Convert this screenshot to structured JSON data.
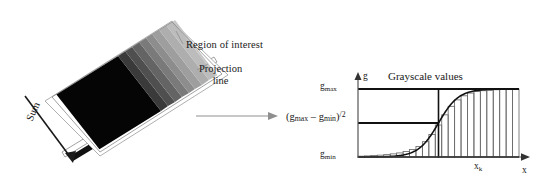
{
  "figure": {
    "background": "#ffffff"
  },
  "left_panel": {
    "name": "region-of-interest-diagram",
    "roi_label": "Region of interest",
    "projection_label_line1": "Projection",
    "projection_label_line2": "line",
    "sum_label": "Sum",
    "gradient_description": "tilted rectangular image patch, black on the left fading through discrete gray steps to light gray on the right",
    "gradient_steps": [
      "#050505",
      "#0a0a0a",
      "#101010",
      "#161616",
      "#434343",
      "#555555",
      "#6a6a6a",
      "#7c7c7c",
      "#8e8e8e",
      "#9f9f9f",
      "#adadad",
      "#b8b8b8",
      "#c2c2c2",
      "#cacaca",
      "#d0d0d0",
      "#d4d4d4"
    ],
    "colors": {
      "plate_border": "#8a8a8a",
      "plate_face": "#ffffff",
      "projection_bar": "#111111",
      "arrow": "#222222"
    }
  },
  "connector": {
    "name": "flow-arrow",
    "color": "#8f8f8f"
  },
  "chart_data": {
    "type": "bar",
    "title": "Grayscale values",
    "xlabel": "x",
    "ylabel": "g",
    "grid": false,
    "legend": false,
    "axis_arrows": true,
    "ylim": [
      0,
      1
    ],
    "ytick_labels": [
      "g_min",
      "g_max"
    ],
    "ytick_values": [
      0,
      1
    ],
    "xtick_labels": [
      "x_k"
    ],
    "xtick_values": [
      0.5
    ],
    "reference_lines": [
      {
        "name": "gmax-line",
        "y": 1.0,
        "label": "g_max"
      },
      {
        "name": "half-amplitude-line",
        "y": 0.5,
        "label": "(g_max - g_min)/2"
      }
    ],
    "vertical_marker": {
      "name": "xk-marker",
      "x": 0.5,
      "label": "x_k"
    },
    "annotations": [
      {
        "name": "gmax-annotation",
        "text": "gmax"
      },
      {
        "name": "gmin-annotation",
        "text": "gmin"
      },
      {
        "name": "formula-annotation",
        "text": "(gmax - gmin)/2"
      },
      {
        "name": "xk-annotation",
        "text": "xk"
      }
    ],
    "curve": {
      "name": "sigmoid-fit-curve",
      "description": "smooth logistic S-curve rising from g_min to g_max, inflection at x_k",
      "color": "#111111"
    },
    "categories": [
      0.02,
      0.06,
      0.1,
      0.14,
      0.18,
      0.22,
      0.26,
      0.3,
      0.34,
      0.38,
      0.42,
      0.46,
      0.5,
      0.54,
      0.58,
      0.62,
      0.66,
      0.7,
      0.74,
      0.78,
      0.82,
      0.86,
      0.9,
      0.94,
      0.98
    ],
    "values": [
      0.012,
      0.016,
      0.021,
      0.027,
      0.035,
      0.046,
      0.06,
      0.08,
      0.11,
      0.155,
      0.225,
      0.33,
      0.47,
      0.62,
      0.745,
      0.84,
      0.9,
      0.94,
      0.962,
      0.975,
      0.983,
      0.989,
      0.993,
      0.996,
      0.998
    ]
  },
  "chart_labels": {
    "title": "Grayscale values",
    "y_axis": "g",
    "x_axis": "x",
    "gmax_base": "g",
    "gmax_sub": "max",
    "gmin_base": "g",
    "gmin_sub": "min",
    "xk_base": "x",
    "xk_sub": "k",
    "formula_open": "(g",
    "formula_sub1": "max",
    "formula_minus": " – g",
    "formula_sub2": "min",
    "formula_close": ")",
    "formula_divisor": "/2"
  },
  "colors": {
    "ink": "#1a1a1a",
    "axis": "#555555",
    "bar_stroke": "#6b6b6b",
    "curve": "#111111",
    "reference_line": "#111111",
    "connector_arrow": "#8f8f8f"
  }
}
